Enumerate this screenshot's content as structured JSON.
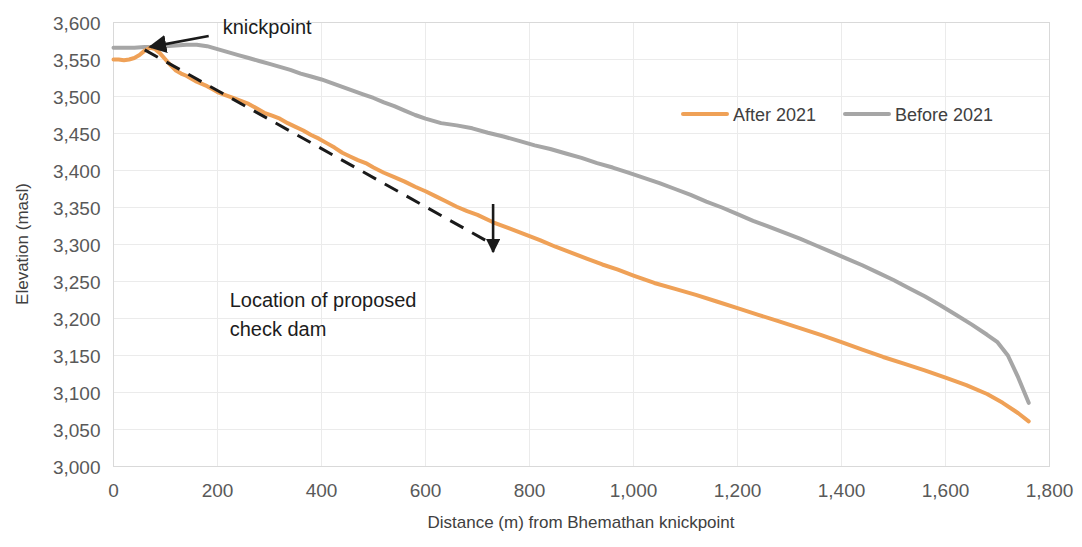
{
  "chart_data": {
    "type": "line",
    "title": "",
    "xlabel": "Distance (m) from Bhemathan knickpoint",
    "ylabel": "Elevation (masl)",
    "xlim": [
      0,
      1800
    ],
    "ylim": [
      3000,
      3600
    ],
    "xticks": [
      "0",
      "200",
      "400",
      "600",
      "800",
      "1,000",
      "1,200",
      "1,400",
      "1,600",
      "1,800"
    ],
    "xtick_values": [
      0,
      200,
      400,
      600,
      800,
      1000,
      1200,
      1400,
      1600,
      1800
    ],
    "yticks": [
      "3,000",
      "3,050",
      "3,100",
      "3,150",
      "3,200",
      "3,250",
      "3,300",
      "3,350",
      "3,400",
      "3,450",
      "3,500",
      "3,550",
      "3,600"
    ],
    "ytick_values": [
      3000,
      3050,
      3100,
      3150,
      3200,
      3250,
      3300,
      3350,
      3400,
      3450,
      3500,
      3550,
      3600
    ],
    "grid": "both-faint",
    "legend_position": "top-right-inside",
    "series": [
      {
        "name": "After 2021",
        "color": "#EFA157",
        "width": 4,
        "x": [
          0,
          10,
          20,
          30,
          40,
          50,
          60,
          70,
          80,
          90,
          100,
          110,
          120,
          130,
          140,
          150,
          160,
          170,
          180,
          190,
          200,
          215,
          230,
          245,
          260,
          275,
          290,
          305,
          320,
          335,
          350,
          365,
          380,
          395,
          410,
          425,
          440,
          455,
          470,
          485,
          500,
          520,
          540,
          560,
          580,
          600,
          620,
          640,
          660,
          680,
          700,
          730,
          760,
          790,
          820,
          850,
          880,
          910,
          940,
          970,
          1000,
          1040,
          1080,
          1120,
          1160,
          1200,
          1240,
          1280,
          1320,
          1360,
          1400,
          1440,
          1480,
          1520,
          1560,
          1600,
          1640,
          1680,
          1710,
          1740,
          1760
        ],
        "y": [
          3550,
          3550,
          3549,
          3550,
          3552,
          3556,
          3562,
          3566,
          3564,
          3558,
          3550,
          3542,
          3535,
          3531,
          3528,
          3524,
          3520,
          3517,
          3514,
          3510,
          3506,
          3502,
          3498,
          3494,
          3490,
          3484,
          3478,
          3474,
          3470,
          3464,
          3459,
          3454,
          3448,
          3443,
          3437,
          3431,
          3424,
          3419,
          3414,
          3410,
          3404,
          3397,
          3391,
          3385,
          3378,
          3372,
          3365,
          3358,
          3351,
          3345,
          3340,
          3330,
          3322,
          3314,
          3306,
          3297,
          3289,
          3281,
          3273,
          3266,
          3258,
          3248,
          3240,
          3232,
          3223,
          3214,
          3205,
          3196,
          3187,
          3178,
          3168,
          3158,
          3148,
          3139,
          3130,
          3120,
          3110,
          3098,
          3086,
          3072,
          3061
        ]
      },
      {
        "name": "Before 2021",
        "color": "#A6A6A6",
        "width": 4,
        "x": [
          0,
          20,
          40,
          60,
          80,
          100,
          120,
          140,
          160,
          180,
          200,
          220,
          240,
          260,
          280,
          300,
          320,
          340,
          360,
          380,
          400,
          420,
          440,
          460,
          480,
          500,
          520,
          540,
          560,
          580,
          600,
          630,
          660,
          690,
          720,
          750,
          780,
          810,
          840,
          870,
          900,
          930,
          960,
          990,
          1020,
          1050,
          1080,
          1110,
          1140,
          1170,
          1200,
          1230,
          1260,
          1290,
          1320,
          1350,
          1380,
          1410,
          1440,
          1470,
          1500,
          1530,
          1560,
          1590,
          1620,
          1650,
          1680,
          1700,
          1720,
          1740,
          1760
        ],
        "y": [
          3566,
          3566,
          3566,
          3567,
          3567,
          3568,
          3569,
          3570,
          3570,
          3568,
          3564,
          3560,
          3556,
          3552,
          3548,
          3544,
          3540,
          3536,
          3531,
          3527,
          3523,
          3518,
          3513,
          3508,
          3503,
          3498,
          3492,
          3487,
          3481,
          3475,
          3470,
          3464,
          3461,
          3457,
          3451,
          3446,
          3440,
          3434,
          3429,
          3423,
          3417,
          3410,
          3404,
          3397,
          3390,
          3383,
          3375,
          3367,
          3358,
          3350,
          3341,
          3332,
          3324,
          3316,
          3308,
          3299,
          3290,
          3281,
          3272,
          3262,
          3252,
          3241,
          3230,
          3218,
          3205,
          3192,
          3178,
          3168,
          3150,
          3120,
          3086
        ]
      }
    ],
    "projection_line": {
      "name": "knickpoint projection",
      "style": "dashed",
      "color": "#1A1A1A",
      "x": [
        60,
        730
      ],
      "y": [
        3563,
        3300
      ]
    },
    "annotations": [
      {
        "label": "knickpoint",
        "target_x": 60,
        "target_y": 3563,
        "text_x": 210,
        "text_y": 3598,
        "arrow": "line-with-arrowhead"
      },
      {
        "label_line1": "Location of proposed",
        "label_line2": "check dam",
        "target_x": 730,
        "target_y": 3298,
        "text_x": 560,
        "text_y": 3215,
        "arrow": "up-arrow"
      }
    ]
  },
  "legend": {
    "items": [
      {
        "label": "After 2021",
        "color": "#EFA157"
      },
      {
        "label": "Before 2021",
        "color": "#A6A6A6"
      }
    ]
  },
  "axes": {
    "y_title": "Elevation (masl)",
    "x_title": "Distance (m) from Bhemathan knickpoint"
  },
  "annotations": {
    "knickpoint": "knickpoint",
    "check_dam_line1": "Location of proposed",
    "check_dam_line2": "check dam"
  }
}
